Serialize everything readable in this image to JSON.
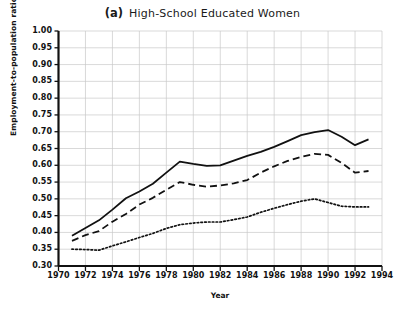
{
  "chart_data": {
    "type": "line",
    "title": "High-School Educated Women",
    "panel_letter": "(a)",
    "xlabel": "Year",
    "ylabel": "Employment-to-population ratio",
    "xlim": [
      1970,
      1994
    ],
    "ylim": [
      0.3,
      1.0
    ],
    "grid": true,
    "legend_position": "none",
    "xticks": [
      1970,
      1972,
      1974,
      1976,
      1978,
      1980,
      1982,
      1984,
      1986,
      1988,
      1990,
      1992,
      1994
    ],
    "yticks": [
      "0.30",
      "0.35",
      "0.40",
      "0.45",
      "0.50",
      "0.55",
      "0.60",
      "0.65",
      "0.70",
      "0.75",
      "0.80",
      "0.85",
      "0.90",
      "0.95",
      "1.00"
    ],
    "x": [
      1971,
      1972,
      1973,
      1974,
      1975,
      1976,
      1977,
      1978,
      1979,
      1980,
      1981,
      1982,
      1983,
      1984,
      1985,
      1986,
      1987,
      1988,
      1989,
      1990,
      1991,
      1992,
      1993
    ],
    "series": [
      {
        "name": "solid-series",
        "style": "solid",
        "color": "#111111",
        "values": [
          0.39,
          0.413,
          0.436,
          0.468,
          0.502,
          0.522,
          0.545,
          0.578,
          0.611,
          0.604,
          0.598,
          0.6,
          0.614,
          0.628,
          0.64,
          0.655,
          0.672,
          0.69,
          0.699,
          0.705,
          0.685,
          0.66,
          0.677
        ]
      },
      {
        "name": "dashed-series",
        "style": "dashed",
        "color": "#111111",
        "values": [
          0.375,
          0.392,
          0.404,
          0.432,
          0.455,
          0.483,
          0.503,
          0.527,
          0.55,
          0.542,
          0.536,
          0.54,
          0.546,
          0.556,
          0.578,
          0.597,
          0.613,
          0.625,
          0.634,
          0.631,
          0.607,
          0.578,
          0.583
        ]
      },
      {
        "name": "dotted-series",
        "style": "dotted",
        "color": "#111111",
        "values": [
          0.35,
          0.349,
          0.347,
          0.36,
          0.372,
          0.385,
          0.397,
          0.412,
          0.423,
          0.428,
          0.431,
          0.431,
          0.438,
          0.446,
          0.46,
          0.472,
          0.483,
          0.493,
          0.5,
          0.489,
          0.478,
          0.476,
          0.476
        ]
      }
    ]
  }
}
